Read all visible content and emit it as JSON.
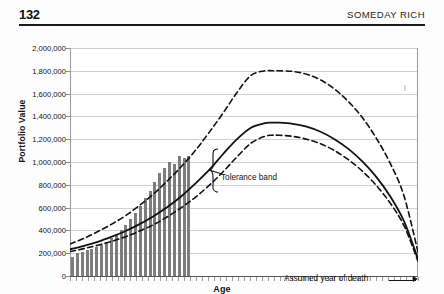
{
  "runhead": {
    "folio": "132",
    "book_title": "SOMEDAY RICH"
  },
  "chart_data": {
    "type": "line",
    "title": "",
    "subtitle": "",
    "xlabel": "Age",
    "ylabel": "Portfolio Value",
    "ylim": [
      0,
      2000000
    ],
    "grid": true,
    "legend": "none",
    "ytick_labels": [
      "2,000,000",
      "1,800,000",
      "1,600,000",
      "1,400,000",
      "1,200,000",
      "1,000,000",
      "800,000",
      "600,000",
      "400,000",
      "200,000",
      "0"
    ],
    "ytick_values": [
      2000000,
      1800000,
      1600000,
      1400000,
      1200000,
      1000000,
      800000,
      600000,
      400000,
      200000,
      0
    ],
    "xtick_labels": [],
    "x_note": "Age axis shown with unlabeled yearly tick marks",
    "series": [
      {
        "name": "Upper tolerance bound",
        "style": "dashed",
        "color": "#111111",
        "x": [
          0,
          4,
          8,
          12,
          16,
          20,
          24,
          28,
          32,
          36,
          40,
          44,
          48,
          52,
          56,
          58,
          60,
          64,
          68,
          72,
          76,
          80,
          84,
          88,
          92,
          96,
          100
        ],
        "values": [
          280000,
          330000,
          390000,
          455000,
          530000,
          620000,
          720000,
          835000,
          960000,
          1100000,
          1260000,
          1430000,
          1610000,
          1760000,
          1800000,
          1800000,
          1800000,
          1795000,
          1770000,
          1720000,
          1640000,
          1530000,
          1390000,
          1210000,
          990000,
          700000,
          210000
        ]
      },
      {
        "name": "Expected portfolio path",
        "style": "solid",
        "color": "#111111",
        "x": [
          0,
          4,
          8,
          12,
          16,
          20,
          24,
          28,
          32,
          36,
          40,
          44,
          48,
          52,
          56,
          58,
          60,
          64,
          68,
          72,
          76,
          80,
          84,
          88,
          92,
          96,
          100
        ],
        "values": [
          235000,
          265000,
          300000,
          345000,
          395000,
          455000,
          525000,
          605000,
          700000,
          810000,
          930000,
          1070000,
          1200000,
          1300000,
          1340000,
          1345000,
          1345000,
          1335000,
          1310000,
          1265000,
          1200000,
          1115000,
          1005000,
          870000,
          700000,
          480000,
          150000
        ]
      },
      {
        "name": "Lower tolerance bound",
        "style": "dashed",
        "color": "#111111",
        "x": [
          0,
          4,
          8,
          12,
          16,
          20,
          24,
          28,
          32,
          36,
          40,
          44,
          48,
          52,
          56,
          58,
          60,
          64,
          68,
          72,
          76,
          80,
          84,
          88,
          92,
          96,
          100
        ],
        "values": [
          215000,
          240000,
          270000,
          305000,
          345000,
          395000,
          450000,
          520000,
          600000,
          690000,
          795000,
          915000,
          1045000,
          1165000,
          1225000,
          1235000,
          1235000,
          1225000,
          1200000,
          1160000,
          1100000,
          1020000,
          920000,
          795000,
          640000,
          440000,
          130000
        ]
      },
      {
        "name": "Accumulated savings (bars)",
        "style": "bar",
        "color": "#7d7d7d",
        "x": [
          0,
          1,
          2,
          3,
          4,
          5,
          6,
          7,
          8,
          9,
          10,
          11,
          12,
          13,
          14,
          15,
          16,
          17,
          18,
          19,
          20,
          21,
          22,
          23,
          24
        ],
        "values": [
          165000,
          205000,
          215000,
          225000,
          240000,
          255000,
          275000,
          300000,
          330000,
          365000,
          405000,
          450000,
          500000,
          555000,
          615000,
          680000,
          750000,
          825000,
          905000,
          950000,
          1000000,
          985000,
          1050000,
          1035000,
          1050000
        ]
      }
    ],
    "annotations": [
      {
        "name": "tolerance-band",
        "text": "Tolerance band",
        "marker": "curly-brace with leader line pointing left into band"
      },
      {
        "name": "assumed-year-of-death",
        "text": "Assumed year of death",
        "marker": "horizontal arrow pointing right to plot edge"
      }
    ]
  }
}
